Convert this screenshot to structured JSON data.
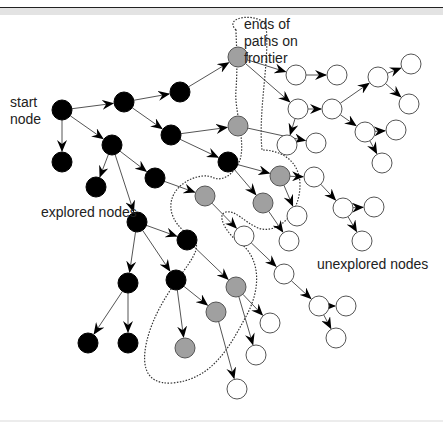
{
  "labels": {
    "start_node": [
      "start",
      "node"
    ],
    "frontier": [
      "ends of",
      "paths on",
      "frontier"
    ],
    "explored": "explored nodes",
    "unexplored": "unexplored nodes"
  },
  "colors": {
    "explored": "#000000",
    "frontier": "#a0a0a0",
    "unexplored": "#ffffff",
    "edge": "#555555"
  },
  "nodes": [
    {
      "id": "s",
      "x": 62,
      "y": 110,
      "type": "explored"
    },
    {
      "id": "a",
      "x": 124,
      "y": 102,
      "type": "explored"
    },
    {
      "id": "b",
      "x": 180,
      "y": 92,
      "type": "explored"
    },
    {
      "id": "c",
      "x": 62,
      "y": 162,
      "type": "explored"
    },
    {
      "id": "d",
      "x": 112,
      "y": 145,
      "type": "explored"
    },
    {
      "id": "e",
      "x": 171,
      "y": 135,
      "type": "explored"
    },
    {
      "id": "f",
      "x": 96,
      "y": 187,
      "type": "explored"
    },
    {
      "id": "g",
      "x": 155,
      "y": 178,
      "type": "explored"
    },
    {
      "id": "h",
      "x": 228,
      "y": 162,
      "type": "explored"
    },
    {
      "id": "i",
      "x": 137,
      "y": 222,
      "type": "explored"
    },
    {
      "id": "j",
      "x": 187,
      "y": 240,
      "type": "explored"
    },
    {
      "id": "k",
      "x": 128,
      "y": 283,
      "type": "explored"
    },
    {
      "id": "l",
      "x": 176,
      "y": 280,
      "type": "explored"
    },
    {
      "id": "m",
      "x": 88,
      "y": 343,
      "type": "explored"
    },
    {
      "id": "n",
      "x": 128,
      "y": 343,
      "type": "explored"
    },
    {
      "id": "F1",
      "x": 238,
      "y": 57,
      "type": "frontier"
    },
    {
      "id": "F2",
      "x": 238,
      "y": 126,
      "type": "frontier"
    },
    {
      "id": "F3",
      "x": 280,
      "y": 176,
      "type": "frontier"
    },
    {
      "id": "F4",
      "x": 205,
      "y": 196,
      "type": "frontier"
    },
    {
      "id": "F5",
      "x": 263,
      "y": 203,
      "type": "frontier"
    },
    {
      "id": "F6",
      "x": 236,
      "y": 287,
      "type": "frontier"
    },
    {
      "id": "F7",
      "x": 216,
      "y": 312,
      "type": "frontier"
    },
    {
      "id": "F8",
      "x": 185,
      "y": 348,
      "type": "frontier"
    },
    {
      "id": "u1",
      "x": 296,
      "y": 75,
      "type": "unexplored"
    },
    {
      "id": "u2",
      "x": 337,
      "y": 75,
      "type": "unexplored"
    },
    {
      "id": "u3",
      "x": 298,
      "y": 109,
      "type": "unexplored"
    },
    {
      "id": "u4",
      "x": 332,
      "y": 109,
      "type": "unexplored"
    },
    {
      "id": "u5",
      "x": 378,
      "y": 77,
      "type": "unexplored"
    },
    {
      "id": "u6",
      "x": 411,
      "y": 64,
      "type": "unexplored"
    },
    {
      "id": "u7",
      "x": 409,
      "y": 104,
      "type": "unexplored"
    },
    {
      "id": "u8",
      "x": 316,
      "y": 143,
      "type": "unexplored"
    },
    {
      "id": "u9",
      "x": 365,
      "y": 132,
      "type": "unexplored"
    },
    {
      "id": "u10",
      "x": 396,
      "y": 130,
      "type": "unexplored"
    },
    {
      "id": "u11",
      "x": 382,
      "y": 163,
      "type": "unexplored"
    },
    {
      "id": "u12",
      "x": 287,
      "y": 145,
      "type": "unexplored"
    },
    {
      "id": "u13",
      "x": 314,
      "y": 177,
      "type": "unexplored"
    },
    {
      "id": "u14",
      "x": 343,
      "y": 208,
      "type": "unexplored"
    },
    {
      "id": "u15",
      "x": 374,
      "y": 207,
      "type": "unexplored"
    },
    {
      "id": "u16",
      "x": 297,
      "y": 216,
      "type": "unexplored"
    },
    {
      "id": "u17",
      "x": 362,
      "y": 241,
      "type": "unexplored"
    },
    {
      "id": "u18",
      "x": 244,
      "y": 236,
      "type": "unexplored"
    },
    {
      "id": "u19",
      "x": 289,
      "y": 241,
      "type": "unexplored"
    },
    {
      "id": "u20",
      "x": 284,
      "y": 274,
      "type": "unexplored"
    },
    {
      "id": "u21",
      "x": 319,
      "y": 306,
      "type": "unexplored"
    },
    {
      "id": "u22",
      "x": 346,
      "y": 306,
      "type": "unexplored"
    },
    {
      "id": "u23",
      "x": 336,
      "y": 338,
      "type": "unexplored"
    },
    {
      "id": "u24",
      "x": 270,
      "y": 323,
      "type": "unexplored"
    },
    {
      "id": "u25",
      "x": 256,
      "y": 355,
      "type": "unexplored"
    },
    {
      "id": "u26",
      "x": 237,
      "y": 389,
      "type": "unexplored"
    }
  ],
  "edges": [
    [
      "s",
      "a"
    ],
    [
      "s",
      "c"
    ],
    [
      "s",
      "d"
    ],
    [
      "a",
      "b"
    ],
    [
      "a",
      "e"
    ],
    [
      "b",
      "F1"
    ],
    [
      "e",
      "F2"
    ],
    [
      "e",
      "h"
    ],
    [
      "d",
      "f"
    ],
    [
      "d",
      "g"
    ],
    [
      "d",
      "i"
    ],
    [
      "g",
      "F4"
    ],
    [
      "h",
      "F3"
    ],
    [
      "h",
      "F5"
    ],
    [
      "i",
      "j"
    ],
    [
      "i",
      "k"
    ],
    [
      "i",
      "l"
    ],
    [
      "k",
      "m"
    ],
    [
      "k",
      "n"
    ],
    [
      "l",
      "F8"
    ],
    [
      "l",
      "F7"
    ],
    [
      "j",
      "F6"
    ],
    [
      "F1",
      "u1"
    ],
    [
      "u1",
      "u2"
    ],
    [
      "F1",
      "u3"
    ],
    [
      "u3",
      "u4"
    ],
    [
      "u3",
      "u12"
    ],
    [
      "u4",
      "u5"
    ],
    [
      "u5",
      "u6"
    ],
    [
      "u5",
      "u7"
    ],
    [
      "u4",
      "u9"
    ],
    [
      "u9",
      "u10"
    ],
    [
      "u9",
      "u11"
    ],
    [
      "F2",
      "u8"
    ],
    [
      "F3",
      "u13"
    ],
    [
      "F3",
      "u16"
    ],
    [
      "u13",
      "u14"
    ],
    [
      "u14",
      "u15"
    ],
    [
      "u14",
      "u17"
    ],
    [
      "F5",
      "u19"
    ],
    [
      "F4",
      "u18"
    ],
    [
      "u18",
      "u20"
    ],
    [
      "u20",
      "u21"
    ],
    [
      "u21",
      "u22"
    ],
    [
      "u21",
      "u23"
    ],
    [
      "F6",
      "u24"
    ],
    [
      "F6",
      "u25"
    ],
    [
      "F7",
      "u26"
    ]
  ]
}
